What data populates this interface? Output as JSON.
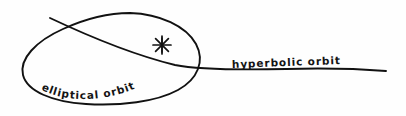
{
  "diagram": {
    "background_color": "#fefefe",
    "ink_color": "#111111",
    "labels": {
      "elliptical": "elliptical orbit",
      "hyperbolic": "hyperbolic orbit"
    },
    "symbols": {
      "star": "star-asterisk-icon",
      "star_rays": 8
    },
    "shapes": {
      "ellipse": "elliptical-orbit-path",
      "hyperbola": "hyperbolic-orbit-path"
    }
  }
}
